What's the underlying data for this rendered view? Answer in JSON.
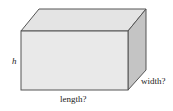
{
  "diagram": {
    "type": "rectangular-prism",
    "labels": {
      "height": "h",
      "length": "length?",
      "width": "width?"
    },
    "colors": {
      "front": "#e9e9e9",
      "top": "#e4e4e4",
      "side": "#c4c4c4",
      "edge": "#555555"
    }
  }
}
